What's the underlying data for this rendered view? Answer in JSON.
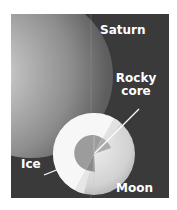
{
  "figure": {
    "labels": {
      "saturn": "Saturn",
      "rocky_core_line1": "Rocky",
      "rocky_core_line2": "core",
      "ice": "Ice",
      "moon": "Moon"
    },
    "colors": {
      "background": "#3a3a3a",
      "saturn_light": "#e8e8e8",
      "saturn_dark": "#6e6e6e",
      "ice": "#f7f7f7",
      "core": "#9c9c9c",
      "moon_surface": "#d6d6d6",
      "label_text": "#ffffff"
    }
  }
}
